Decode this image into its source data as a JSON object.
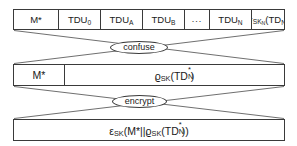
{
  "diagram": {
    "stroke_color": "#3a3a3a",
    "background_color": "#ffffff",
    "rows": [
      {
        "name": "tdu-table",
        "cells": [
          {
            "name": "m-star",
            "text": "M*"
          },
          {
            "name": "tdu-0",
            "text": "TDU₀"
          },
          {
            "name": "tdu-a",
            "text": "TDUₐ"
          },
          {
            "name": "tdu-b",
            "text": "TDUʙ"
          },
          {
            "name": "tdu-ellipsis",
            "text": "..."
          },
          {
            "name": "tdu-n",
            "text": "TDUₙ"
          },
          {
            "name": "sigma-sk-n-td-n",
            "text": "σₛₖₙ(TDₙ)"
          }
        ]
      },
      {
        "name": "confused-row",
        "cells": [
          {
            "name": "m-star",
            "text": "M*"
          },
          {
            "name": "rho-sk-td-star-n",
            "text": "ϱₛₖ(TD*ₙ)"
          }
        ]
      },
      {
        "name": "encrypted-row",
        "cells": [
          {
            "name": "epsilon-sk-full",
            "text": "εₛₖ(M*||ϱₛₖ(TD*ₙ))"
          }
        ]
      }
    ],
    "operations": [
      {
        "name": "confuse",
        "label": "confuse"
      },
      {
        "name": "encrypt",
        "label": "encrypt"
      }
    ],
    "symbols": {
      "m_star": "M*",
      "tdu": "TDU",
      "td": "TD",
      "sigma": "σ",
      "rho": "ϱ",
      "epsilon": "ε",
      "sk": "SK",
      "sub_zero": "0",
      "sub_a": "A",
      "sub_b": "B",
      "sub_n": "N",
      "ellipsis": "...",
      "concat": "||",
      "star": "*",
      "paren_open": "(",
      "paren_close": ")"
    }
  }
}
